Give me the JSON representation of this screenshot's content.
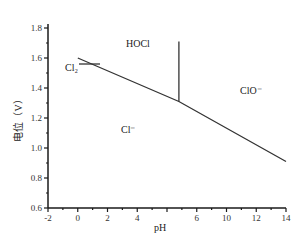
{
  "chart_data": {
    "type": "line",
    "title": "",
    "xlabel": "pH",
    "ylabel": "电位（V）",
    "xlim": [
      -2,
      14
    ],
    "ylim": [
      0.6,
      1.8
    ],
    "grid": false,
    "x_tick_labels": [
      {
        "value": -2,
        "label": "-2"
      },
      {
        "value": 0,
        "label": "0"
      },
      {
        "value": 2,
        "label": "2"
      },
      {
        "value": 4,
        "label": "4"
      },
      {
        "value": 8,
        "label": "6"
      },
      {
        "value": 10,
        "label": "10"
      },
      {
        "value": 12,
        "label": "12"
      },
      {
        "value": 14,
        "label": "14"
      }
    ],
    "y_tick_labels": [
      "0.6",
      "0.8",
      "1.0",
      "1.2",
      "1.4",
      "1.6",
      "1.8"
    ],
    "series": [
      {
        "name": "Cl- / HOCl,ClO- boundary",
        "x": [
          0,
          6.8,
          14
        ],
        "y": [
          1.6,
          1.31,
          0.91
        ]
      },
      {
        "name": "HOCl / ClO- boundary",
        "x": [
          6.8,
          6.8
        ],
        "y": [
          1.31,
          1.71
        ]
      }
    ],
    "annotations": [
      {
        "text": "HOCl",
        "x": 4.3,
        "y": 1.69
      },
      {
        "text": "Cl₂",
        "x": 0.6,
        "y": 1.54,
        "arrow_to": {
          "x": 1.4,
          "y": 1.54
        }
      },
      {
        "text": "ClO⁻",
        "x": 11.3,
        "y": 1.42
      },
      {
        "text": "Cl⁻",
        "x": 3.9,
        "y": 1.14
      }
    ]
  },
  "labels": {
    "xlabel": "pH",
    "ylabel": "电位（V）",
    "hocl": "HOCl",
    "cl2": "Cl₂",
    "clo": "ClO⁻",
    "cl": "Cl⁻"
  }
}
